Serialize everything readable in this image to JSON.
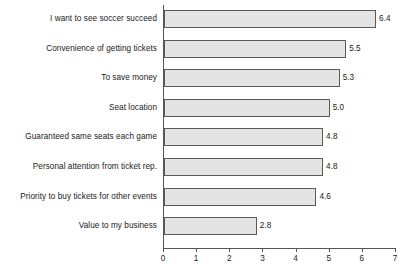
{
  "chart_data": {
    "type": "bar",
    "orientation": "horizontal",
    "title": "",
    "xlabel": "",
    "ylabel": "",
    "xlim": [
      0,
      7
    ],
    "xticks": [
      "0",
      "1",
      "2",
      "3",
      "4",
      "5",
      "6",
      "7"
    ],
    "grid": false,
    "legend": null,
    "bar_fill_color": "#e4e4e4",
    "bar_border_color": "#5a5a5a",
    "axis_color": "#555555",
    "background_color": "#ffffff",
    "categories": [
      "I want to see soccer succeed",
      "Convenience of getting tickets",
      "To save money",
      "Seat location",
      "Guaranteed same seats each game",
      "Personal attention from ticket rep.",
      "Priority to buy tickets for other events",
      "Value to my business"
    ],
    "values": [
      6.4,
      5.5,
      5.3,
      5.0,
      4.8,
      4.8,
      4.6,
      2.8
    ],
    "value_labels": [
      "6.4",
      "5.5",
      "5.3",
      "5.0",
      "4.8",
      "4.8",
      "4.6",
      "2.8"
    ]
  }
}
